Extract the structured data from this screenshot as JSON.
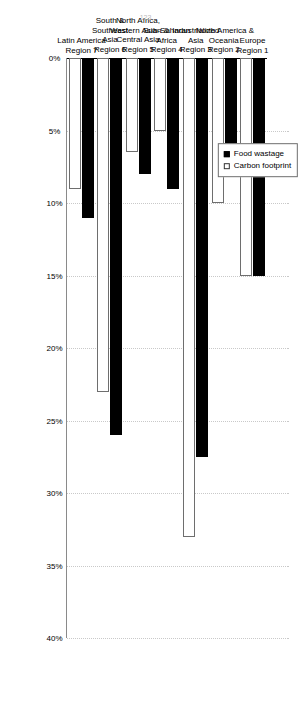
{
  "figure": {
    "page_number": "123"
  },
  "legend": {
    "position": "top-left",
    "entries": [
      {
        "label": "Food wastage",
        "swatch": "black"
      },
      {
        "label": "Carbon footprint",
        "swatch": "white"
      }
    ]
  },
  "axis": {
    "tick_labels": [
      "0%",
      "5%",
      "10%",
      "15%",
      "20%",
      "25%",
      "30%",
      "35%",
      "40%"
    ],
    "tick_values": [
      0,
      5,
      10,
      15,
      20,
      25,
      30,
      35,
      40
    ],
    "min": 0,
    "max": 40
  },
  "chart_data": {
    "type": "bar",
    "orientation": "horizontal",
    "title": "",
    "subtitle": "",
    "xlabel": "",
    "ylabel": "",
    "xlim": [
      0,
      40
    ],
    "grid": true,
    "legend_position": "top-left",
    "categories": [
      "Europe\nRegion 1",
      "North America &\nOceania\nRegion 2",
      "Industrialized\nAsia\nRegion 3",
      "Sub-Saharan\nAfrica\nRegion 4",
      "North Africa,\nWestern Asian &\nCentral Asia\nRegion 5",
      "South &\nSoutheast\nAsia\nRegion 6",
      "Latin America\nRegion 7"
    ],
    "series": [
      {
        "name": "Food wastage",
        "color": "#000000",
        "values": [
          15,
          8,
          27.5,
          9,
          8,
          26,
          11
        ]
      },
      {
        "name": "Carbon footprint",
        "color": "#ffffff",
        "values": [
          15,
          10,
          33,
          5,
          6.5,
          23,
          9
        ]
      }
    ]
  }
}
